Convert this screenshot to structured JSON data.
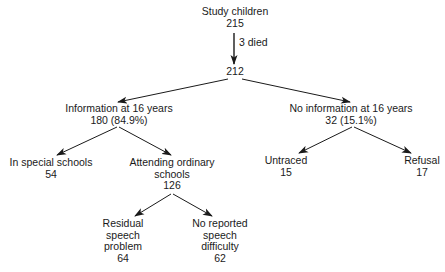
{
  "diagram": {
    "type": "flowchart-tree",
    "nodes": {
      "root": {
        "label": "Study children",
        "count": "215"
      },
      "survivors": {
        "count": "212"
      },
      "info": {
        "label": "Information at 16 years",
        "count": "180 (84.9%)"
      },
      "no_info": {
        "label": "No information at 16 years",
        "count": "32 (15.1%)"
      },
      "special": {
        "label": "In special schools",
        "count": "54"
      },
      "ordinary": {
        "label_line1": "Attending ordinary",
        "label_line2": "schools",
        "count": "126"
      },
      "untraced": {
        "label": "Untraced",
        "count": "15"
      },
      "refusal": {
        "label": "Refusal",
        "count": "17"
      },
      "residual": {
        "label_line1": "Residual",
        "label_line2": "speech",
        "label_line3": "problem",
        "count": "64"
      },
      "no_difficulty": {
        "label_line1": "No reported",
        "label_line2": "speech",
        "label_line3": "difficulty",
        "count": "62"
      }
    },
    "edges": [
      {
        "from": "root",
        "to": "survivors",
        "label": "3 died"
      },
      {
        "from": "survivors",
        "to": "info"
      },
      {
        "from": "survivors",
        "to": "no_info"
      },
      {
        "from": "info",
        "to": "special"
      },
      {
        "from": "info",
        "to": "ordinary"
      },
      {
        "from": "no_info",
        "to": "untraced"
      },
      {
        "from": "no_info",
        "to": "refusal"
      },
      {
        "from": "ordinary",
        "to": "residual"
      },
      {
        "from": "ordinary",
        "to": "no_difficulty"
      }
    ],
    "colors": {
      "line": "#1a1a1a",
      "text": "#1a1a1a",
      "background": "#ffffff"
    }
  }
}
